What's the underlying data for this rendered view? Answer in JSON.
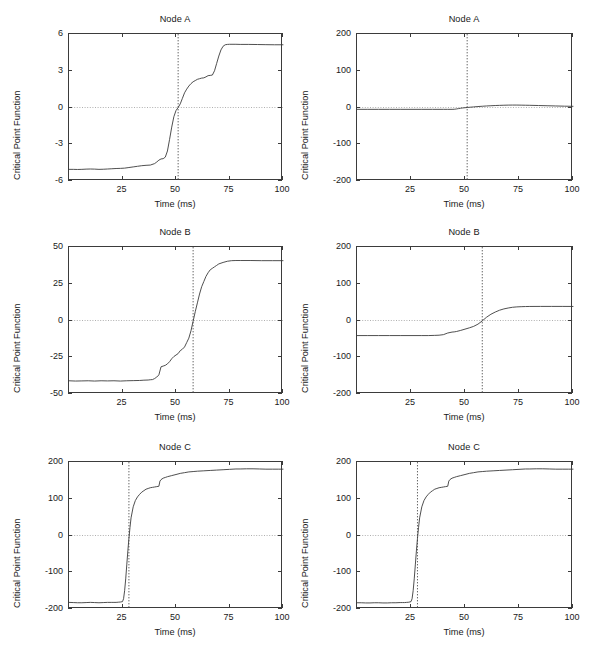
{
  "figure": {
    "background": "#ffffff",
    "line_color": "#3b3b3b",
    "axis_color": "#3b3b3b",
    "marker_color": "#7a7a7a",
    "columns": 2,
    "rows": 3,
    "common_xlabel": "Time (ms)",
    "common_ylabel": "Critical Point Function"
  },
  "chart_data": [
    {
      "id": "node-a-left",
      "type": "line",
      "title": "Node A",
      "xlabel": "Time (ms)",
      "ylabel": "Critical Point Function",
      "xlim": [
        0,
        100
      ],
      "ylim": [
        -6,
        6
      ],
      "xticks": [
        25,
        50,
        75,
        100
      ],
      "xticklabels": [
        "25",
        "50",
        "75",
        "100"
      ],
      "yticks": [
        -6,
        -3,
        0,
        3,
        6
      ],
      "yticklabels": [
        "-6",
        "-3",
        "0",
        "3",
        "6"
      ],
      "grid": false,
      "zero_line": true,
      "marker_line_x": 51,
      "marker_line_label": "51",
      "x": [
        0,
        2,
        4,
        6,
        8,
        10,
        12,
        14,
        16,
        18,
        20,
        22,
        24,
        26,
        28,
        30,
        32,
        34,
        36,
        38,
        40,
        41,
        42,
        43,
        44,
        45,
        46,
        47,
        48,
        49,
        50,
        51,
        52,
        53,
        54,
        55,
        56,
        57,
        58,
        59,
        60,
        61,
        62,
        63,
        64,
        65,
        66,
        67,
        68,
        69,
        70,
        71,
        72,
        73,
        74,
        75,
        78,
        80,
        84,
        88,
        92,
        96,
        100
      ],
      "y": [
        -5.05,
        -5.05,
        -5.06,
        -5.05,
        -5.03,
        -5.02,
        -5.03,
        -5.05,
        -5.04,
        -5.02,
        -5.0,
        -4.98,
        -4.97,
        -4.95,
        -4.9,
        -4.85,
        -4.8,
        -4.75,
        -4.72,
        -4.7,
        -4.58,
        -4.45,
        -4.3,
        -4.2,
        -4.18,
        -4.05,
        -3.55,
        -2.6,
        -1.6,
        -0.75,
        -0.25,
        0.0,
        0.3,
        0.75,
        1.2,
        1.5,
        1.75,
        1.95,
        2.1,
        2.2,
        2.3,
        2.35,
        2.4,
        2.42,
        2.5,
        2.6,
        2.62,
        2.65,
        3.0,
        3.6,
        4.2,
        4.7,
        5.0,
        5.12,
        5.15,
        5.16,
        5.16,
        5.15,
        5.15,
        5.14,
        5.13,
        5.12,
        5.12
      ]
    },
    {
      "id": "node-a-right",
      "type": "line",
      "title": "Node A",
      "xlabel": "Time (ms)",
      "ylabel": "Critical Point Function",
      "xlim": [
        0,
        100
      ],
      "ylim": [
        -200,
        200
      ],
      "xticks": [
        25,
        50,
        75,
        100
      ],
      "xticklabels": [
        "25",
        "50",
        "75",
        "100"
      ],
      "yticks": [
        -200,
        -100,
        0,
        100,
        200
      ],
      "yticklabels": [
        "-200",
        "-100",
        "0",
        "100",
        "200"
      ],
      "grid": false,
      "zero_line": true,
      "marker_line_x": 51,
      "marker_line_label": "51",
      "x": [
        0,
        5,
        10,
        15,
        20,
        25,
        30,
        35,
        40,
        42,
        44,
        45,
        46,
        47,
        48,
        49,
        50,
        51,
        52,
        54,
        56,
        58,
        60,
        62,
        64,
        66,
        68,
        70,
        72,
        74,
        76,
        78,
        80,
        84,
        88,
        92,
        96,
        100
      ],
      "y": [
        -5.0,
        -5.0,
        -5.0,
        -5.0,
        -5.0,
        -5.0,
        -5.0,
        -5.0,
        -5.0,
        -5.0,
        -5.0,
        -4.8,
        -4.0,
        -3.0,
        -2.0,
        -1.2,
        -0.6,
        0.0,
        0.6,
        1.6,
        2.6,
        3.4,
        4.2,
        4.8,
        5.4,
        5.8,
        6.2,
        6.5,
        6.6,
        6.6,
        6.4,
        6.2,
        6.0,
        5.4,
        4.8,
        4.2,
        3.6,
        3.2
      ]
    },
    {
      "id": "node-b-left",
      "type": "line",
      "title": "Node B",
      "xlabel": "Time (ms)",
      "ylabel": "Critical Point Function",
      "xlim": [
        0,
        100
      ],
      "ylim": [
        -50,
        50
      ],
      "xticks": [
        25,
        50,
        75,
        100
      ],
      "xticklabels": [
        "25",
        "50",
        "75",
        "100"
      ],
      "yticks": [
        -50,
        -25,
        0,
        25,
        50
      ],
      "yticklabels": [
        "-50",
        "-25",
        "0",
        "25",
        "50"
      ],
      "grid": false,
      "zero_line": true,
      "marker_line_x": 58,
      "marker_line_label": "58",
      "x": [
        0,
        3,
        6,
        9,
        12,
        15,
        18,
        21,
        24,
        27,
        30,
        33,
        35,
        37,
        38,
        39,
        40,
        41,
        42,
        43,
        44,
        45,
        46,
        47,
        48,
        49,
        50,
        51,
        52,
        53,
        54,
        55,
        56,
        57,
        58,
        59,
        60,
        61,
        62,
        63,
        64,
        65,
        66,
        67,
        68,
        69,
        70,
        72,
        74,
        76,
        78,
        80,
        85,
        90,
        95,
        100
      ],
      "y": [
        -41.0,
        -41.2,
        -41.1,
        -41.0,
        -41.2,
        -41.0,
        -41.1,
        -41.0,
        -41.2,
        -41.0,
        -40.9,
        -40.8,
        -40.6,
        -40.5,
        -40.3,
        -40.2,
        -39.5,
        -38.5,
        -37.0,
        -31.5,
        -31.0,
        -30.5,
        -29.5,
        -28.0,
        -26.0,
        -24.5,
        -23.5,
        -22.5,
        -20.5,
        -19.5,
        -18.0,
        -15.0,
        -12.0,
        -7.0,
        -0.5,
        6.0,
        12.0,
        18.0,
        23.0,
        26.5,
        30.0,
        32.5,
        34.5,
        35.5,
        36.5,
        37.5,
        38.5,
        39.5,
        40.3,
        40.7,
        40.8,
        40.8,
        40.8,
        40.7,
        40.7,
        40.7
      ]
    },
    {
      "id": "node-b-right",
      "type": "line",
      "title": "Node B",
      "xlabel": "Time (ms)",
      "ylabel": "Critical Point Function",
      "xlim": [
        0,
        100
      ],
      "ylim": [
        -200,
        200
      ],
      "xticks": [
        25,
        50,
        75,
        100
      ],
      "xticklabels": [
        "25",
        "50",
        "75",
        "100"
      ],
      "yticks": [
        -200,
        -100,
        0,
        100,
        200
      ],
      "yticklabels": [
        "-200",
        "-100",
        "0",
        "100",
        "200"
      ],
      "grid": false,
      "zero_line": true,
      "marker_line_x": 58,
      "marker_line_label": "58",
      "x": [
        0,
        5,
        10,
        15,
        20,
        25,
        30,
        33,
        36,
        38,
        40,
        42,
        44,
        45,
        46,
        48,
        50,
        52,
        54,
        56,
        58,
        60,
        62,
        64,
        66,
        68,
        70,
        72,
        74,
        76,
        78,
        80,
        85,
        90,
        95,
        100
      ],
      "y": [
        -41.0,
        -41.0,
        -41.0,
        -41.0,
        -41.0,
        -41.0,
        -41.0,
        -41.0,
        -40.5,
        -40.0,
        -38.5,
        -34.0,
        -31.5,
        -31.0,
        -30.0,
        -27.0,
        -23.5,
        -20.0,
        -16.0,
        -10.0,
        -1.0,
        9.0,
        17.0,
        23.0,
        28.0,
        31.5,
        34.0,
        36.0,
        37.0,
        37.6,
        38.0,
        38.2,
        38.3,
        38.3,
        38.3,
        38.2
      ]
    },
    {
      "id": "node-c-left",
      "type": "line",
      "title": "Node C",
      "xlabel": "Time (ms)",
      "ylabel": "Critical Point Function",
      "xlim": [
        0,
        100
      ],
      "ylim": [
        -200,
        200
      ],
      "xticks": [
        25,
        50,
        75,
        100
      ],
      "xticklabels": [
        "25",
        "50",
        "75",
        "100"
      ],
      "yticks": [
        -200,
        -100,
        0,
        100,
        200
      ],
      "yticklabels": [
        "-200",
        "-100",
        "0",
        "100",
        "200"
      ],
      "grid": false,
      "zero_line": true,
      "marker_line_x": 28,
      "marker_line_label": "28",
      "x": [
        0,
        2,
        4,
        6,
        8,
        10,
        12,
        14,
        16,
        18,
        20,
        21,
        22,
        23,
        24,
        25,
        25.5,
        26,
        26.5,
        27,
        27.5,
        28,
        28.5,
        29,
        30,
        31,
        32,
        33,
        34,
        35,
        36,
        37,
        38,
        39,
        40,
        41,
        42,
        42.5,
        43,
        44,
        45,
        46,
        48,
        50,
        52,
        54,
        56,
        58,
        60,
        63,
        66,
        69,
        72,
        75,
        78,
        80,
        83,
        86,
        89,
        92,
        95,
        98,
        100
      ],
      "y": [
        -182,
        -182.5,
        -183,
        -183,
        -182.5,
        -182,
        -182.5,
        -183,
        -182.5,
        -182,
        -182,
        -182,
        -182,
        -181.5,
        -181,
        -180,
        -172,
        -150,
        -118,
        -80,
        -42,
        -8,
        22,
        48,
        78,
        95,
        105,
        112,
        118,
        122,
        126,
        128,
        130,
        131,
        132,
        133,
        134,
        148,
        152,
        156,
        158,
        160,
        163,
        166,
        169,
        171,
        173,
        174,
        175,
        176,
        177,
        178,
        179,
        180,
        181,
        181,
        181.5,
        181.5,
        181,
        180.5,
        180.5,
        180.5,
        180.5
      ]
    },
    {
      "id": "node-c-right",
      "type": "line",
      "title": "Node C",
      "xlabel": "Time (ms)",
      "ylabel": "Critical Point Function",
      "xlim": [
        0,
        100
      ],
      "ylim": [
        -200,
        200
      ],
      "xticks": [
        25,
        50,
        75,
        100
      ],
      "xticklabels": [
        "25",
        "50",
        "75",
        "100"
      ],
      "yticks": [
        -200,
        -100,
        0,
        100,
        200
      ],
      "yticklabels": [
        "-200",
        "-100",
        "0",
        "100",
        "200"
      ],
      "grid": false,
      "zero_line": true,
      "marker_line_x": 28,
      "marker_line_label": "28",
      "x": [
        0,
        2,
        4,
        6,
        8,
        10,
        12,
        14,
        16,
        18,
        20,
        21,
        22,
        23,
        24,
        25,
        25.5,
        26,
        26.5,
        27,
        27.5,
        28,
        28.5,
        29,
        30,
        31,
        32,
        33,
        34,
        35,
        36,
        37,
        38,
        39,
        40,
        41,
        42,
        42.5,
        43,
        44,
        45,
        46,
        48,
        50,
        52,
        54,
        56,
        58,
        60,
        63,
        66,
        69,
        72,
        75,
        78,
        80,
        83,
        86,
        89,
        92,
        95,
        98,
        100
      ],
      "y": [
        -183,
        -183,
        -183.5,
        -183.5,
        -183,
        -183,
        -183.5,
        -183.5,
        -183,
        -183,
        -182.5,
        -182.5,
        -182.5,
        -182,
        -181.5,
        -180,
        -172,
        -150,
        -118,
        -80,
        -42,
        -8,
        22,
        48,
        78,
        95,
        105,
        112,
        118,
        122,
        126,
        128,
        130,
        131,
        132,
        133,
        134,
        148,
        152,
        156,
        158,
        160,
        163,
        166,
        169,
        171,
        173,
        174,
        175,
        176,
        177,
        178,
        179,
        180,
        181,
        181,
        181.5,
        181.5,
        181,
        180.5,
        180.5,
        180.5,
        180.5
      ]
    }
  ]
}
